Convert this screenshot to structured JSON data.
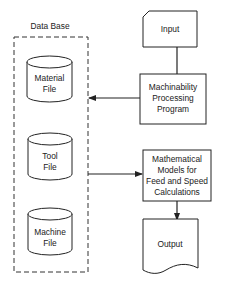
{
  "diagram": {
    "database": {
      "title": "Data Base",
      "files": [
        {
          "line1": "Material",
          "line2": "File"
        },
        {
          "line1": "Tool",
          "line2": "File"
        },
        {
          "line1": "Machine",
          "line2": "File"
        }
      ]
    },
    "input": {
      "label": "Input"
    },
    "processing": {
      "lines": [
        "Machinability",
        "Processing",
        "Program"
      ]
    },
    "models": {
      "lines": [
        "Mathematical",
        "Models for",
        "Feed and Speed",
        "Calculations"
      ]
    },
    "output": {
      "label": "Output"
    },
    "colors": {
      "stroke": "#222222",
      "background": "#ffffff"
    }
  }
}
